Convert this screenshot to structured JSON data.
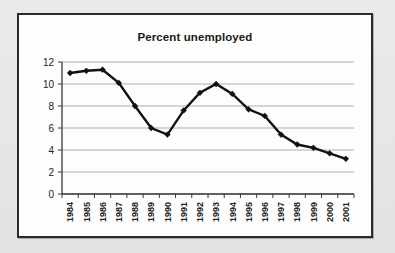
{
  "chart_data": {
    "type": "line",
    "title": "Percent unemployed",
    "xlabel": "",
    "ylabel": "",
    "categories": [
      "1984",
      "1985",
      "1986",
      "1987",
      "1988",
      "1989",
      "1990",
      "1991",
      "1992",
      "1993",
      "1994",
      "1995",
      "1996",
      "1997",
      "1998",
      "1999",
      "2000",
      "2001"
    ],
    "values": [
      11.0,
      11.2,
      11.3,
      10.1,
      8.0,
      6.0,
      5.4,
      7.6,
      9.2,
      10.0,
      9.1,
      7.7,
      7.1,
      5.4,
      4.5,
      4.2,
      3.7,
      3.2
    ],
    "series": [
      {
        "name": "Percent unemployed",
        "values": [
          11.0,
          11.2,
          11.3,
          10.1,
          8.0,
          6.0,
          5.4,
          7.6,
          9.2,
          10.0,
          9.1,
          7.7,
          7.1,
          5.4,
          4.5,
          4.2,
          3.7,
          3.2
        ]
      }
    ],
    "ylim": [
      0,
      12
    ],
    "xlim": [
      1984,
      2001
    ],
    "yticks": [
      0,
      2,
      4,
      6,
      8,
      10,
      12
    ],
    "ytick_labels": [
      "0",
      "2",
      "4",
      "6",
      "8",
      "10",
      "12"
    ],
    "grid": "horizontal",
    "legend": "none",
    "marker": "diamond",
    "line_color": "#111111",
    "grid_color": "#9a9a9a",
    "axis_color": "#3a3a3a",
    "plot_background": "#fdfdfd",
    "xtick_label_rotation": -90
  },
  "figure": {
    "border_color": "#2a2a2a",
    "page_background": "#e8e8e8"
  }
}
